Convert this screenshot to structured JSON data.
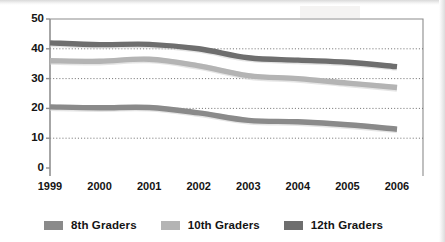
{
  "chart_data": {
    "type": "line",
    "title": "",
    "subtitle": "",
    "xlabel": "",
    "ylabel": "",
    "categories": [
      "1999",
      "2000",
      "2001",
      "2002",
      "2003",
      "2004",
      "2005",
      "2006"
    ],
    "x_tick_labels": [
      "1999",
      "2000",
      "2001",
      "2002",
      "2003",
      "2004",
      "2005",
      "2006"
    ],
    "y_tick_labels": [
      "0",
      "10",
      "20",
      "30",
      "40",
      "50"
    ],
    "y_ticks": [
      0,
      10,
      20,
      30,
      40,
      50
    ],
    "ylim": [
      0,
      50
    ],
    "grid": "horizontal-dotted",
    "legend_position": "bottom",
    "series": [
      {
        "name": "8th Graders",
        "color": "#8a8a8a",
        "values": [
          20.5,
          20.2,
          20.3,
          18.5,
          16.0,
          15.5,
          14.5,
          13.0
        ]
      },
      {
        "name": "10th Graders",
        "color": "#b4b4b4",
        "values": [
          36.0,
          35.8,
          36.5,
          34.3,
          31.0,
          30.0,
          28.5,
          27.0
        ]
      },
      {
        "name": "12th Graders",
        "color": "#6e6e6e",
        "values": [
          42.0,
          41.4,
          41.5,
          40.0,
          37.0,
          36.2,
          35.5,
          34.0
        ]
      }
    ]
  },
  "legend": {
    "items": [
      {
        "label": "8th Graders",
        "color": "#8a8a8a"
      },
      {
        "label": "10th Graders",
        "color": "#b4b4b4"
      },
      {
        "label": "12th Graders",
        "color": "#6e6e6e"
      }
    ]
  },
  "axes": {
    "y_axis_color": "#909090",
    "x_axis_color": "#909090",
    "frame_color": "#8c8c8c",
    "gridline_color": "#6b6b6b"
  }
}
